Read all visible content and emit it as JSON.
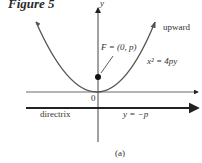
{
  "figure": {
    "title": "Figure 5",
    "caption": "(a)"
  },
  "axes": {
    "y_label": "y",
    "origin_label": "0"
  },
  "labels": {
    "focus": "F = (0, p)",
    "direction": "upward",
    "equation": "x² = 4py",
    "directrix": "directrix",
    "directrix_eq": "y = −p"
  },
  "colors": {
    "curve": "#555555",
    "axis": "#333333",
    "directrix": "#222222",
    "focus": "#111111"
  }
}
